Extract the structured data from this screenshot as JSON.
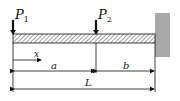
{
  "diagram": {
    "type": "cantilever-beam",
    "loads": [
      {
        "label": "P",
        "subscript": "1",
        "position": "free end"
      },
      {
        "label": "P",
        "subscript": "2",
        "position": "at distance a"
      }
    ],
    "coordinate": {
      "label": "x"
    },
    "dimensions": {
      "a": "a",
      "b": "b",
      "L": "L"
    },
    "support": "fixed wall (right)",
    "colors": {
      "wall": "#a8a8a8",
      "beam_hatch": "#333333",
      "line": "#111111"
    }
  }
}
